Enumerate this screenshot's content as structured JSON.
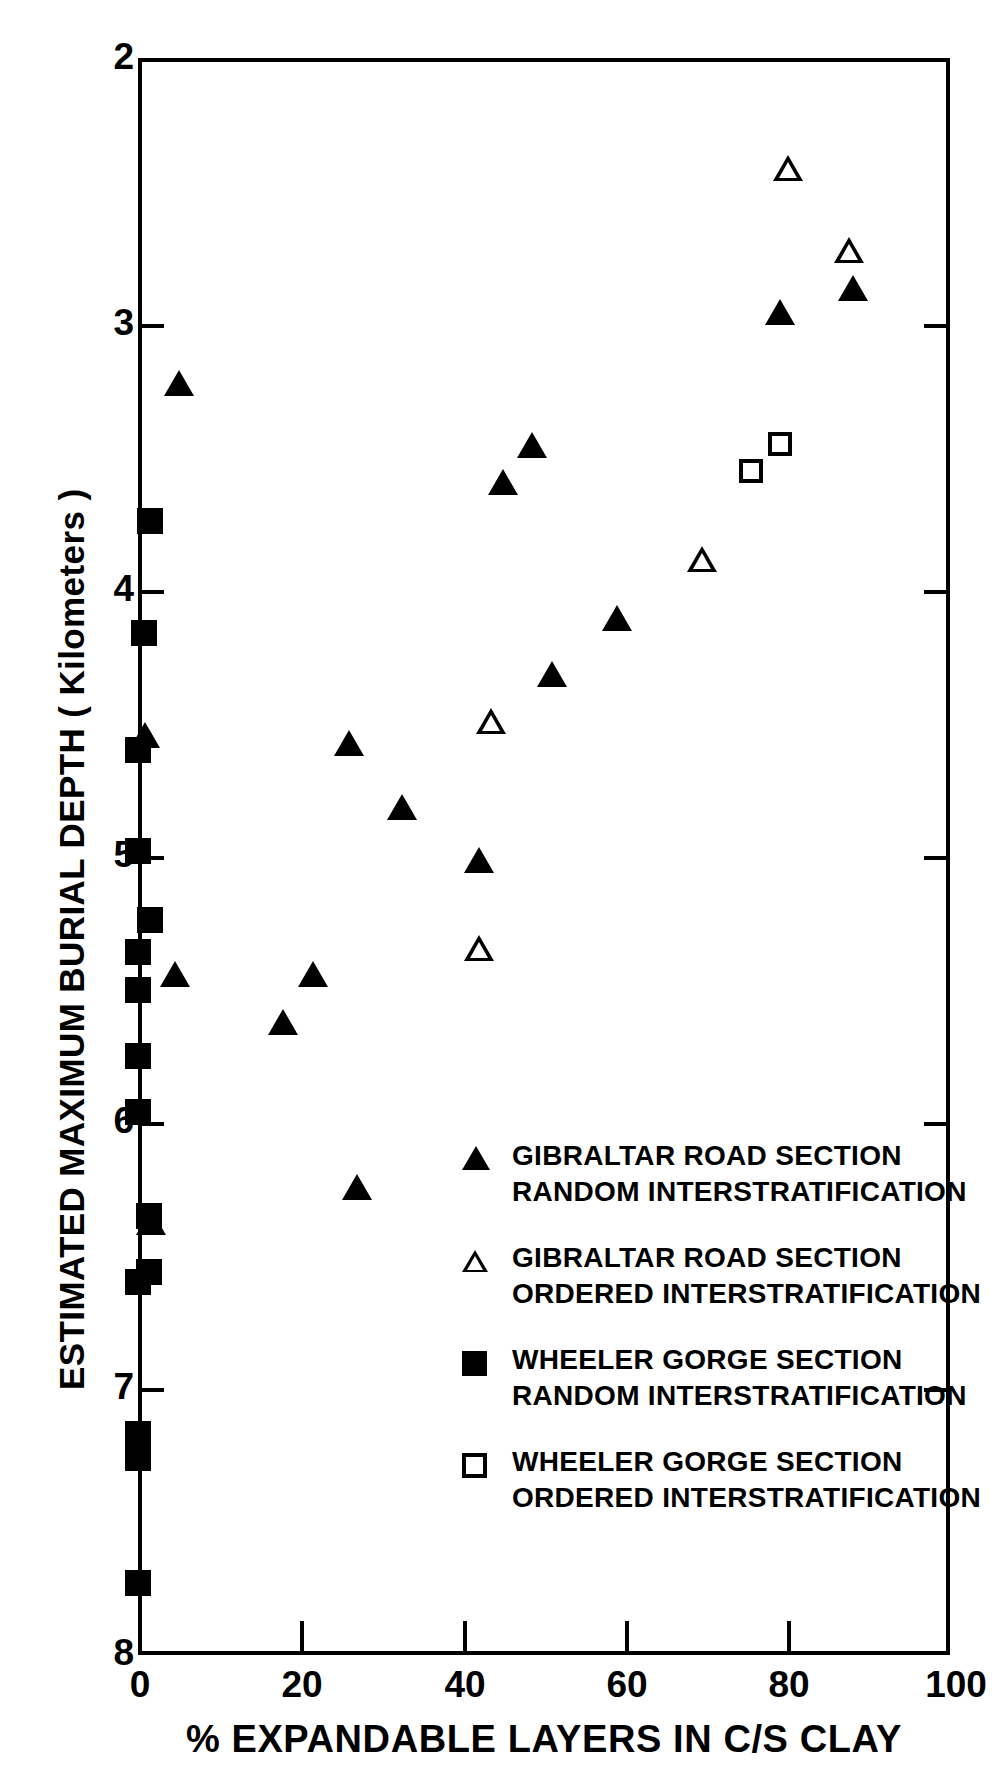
{
  "chart_data": {
    "type": "scatter",
    "title": "",
    "xlabel": "% EXPANDABLE LAYERS IN C/S CLAY",
    "ylabel": "ESTIMATED MAXIMUM BURIAL DEPTH ( Kilometers )",
    "xlim": [
      0,
      100
    ],
    "ylim": [
      8,
      2
    ],
    "y_inverted": true,
    "grid": false,
    "x_ticks": [
      0,
      20,
      40,
      60,
      80,
      100
    ],
    "x_tick_labels": [
      "0",
      "20",
      "40",
      "60",
      "80",
      "100"
    ],
    "y_ticks": [
      2,
      3,
      4,
      5,
      6,
      7,
      8
    ],
    "y_tick_labels": [
      "2",
      "3",
      "4",
      "5",
      "6",
      "7",
      "8"
    ],
    "legend_position": "inside-lower-center-right",
    "series": [
      {
        "name": "GIBRALTAR ROAD SECTION RANDOM INTERSTRATIFICATION",
        "marker": "filled-triangle",
        "color": "#000000",
        "points": [
          {
            "x": 5.0,
            "y": 3.23
          },
          {
            "x": 0.8,
            "y": 4.55
          },
          {
            "x": 1.6,
            "y": 6.38
          },
          {
            "x": 4.6,
            "y": 5.45
          },
          {
            "x": 17.8,
            "y": 5.63
          },
          {
            "x": 21.5,
            "y": 5.45
          },
          {
            "x": 26.0,
            "y": 4.58
          },
          {
            "x": 27.0,
            "y": 6.25
          },
          {
            "x": 32.5,
            "y": 4.82
          },
          {
            "x": 42.0,
            "y": 5.02
          },
          {
            "x": 45.0,
            "y": 3.6
          },
          {
            "x": 48.5,
            "y": 3.46
          },
          {
            "x": 51.0,
            "y": 4.32
          },
          {
            "x": 59.0,
            "y": 4.11
          },
          {
            "x": 79.0,
            "y": 2.96
          },
          {
            "x": 88.0,
            "y": 2.87
          }
        ]
      },
      {
        "name": "GIBRALTAR ROAD SECTION ORDERED INTERSTRATIFICATION",
        "marker": "open-triangle",
        "color": "#000000",
        "points": [
          {
            "x": 43.5,
            "y": 4.5
          },
          {
            "x": 42.0,
            "y": 5.35
          },
          {
            "x": 69.5,
            "y": 3.89
          },
          {
            "x": 80.0,
            "y": 2.42
          },
          {
            "x": 87.5,
            "y": 2.73
          }
        ]
      },
      {
        "name": "WHEELER GORGE SECTION RANDOM INTERSTRATIFICATION",
        "marker": "filled-square",
        "color": "#000000",
        "points": [
          {
            "x": 1.5,
            "y": 3.74
          },
          {
            "x": 0.7,
            "y": 4.16
          },
          {
            "x": 0.0,
            "y": 4.6
          },
          {
            "x": 0.0,
            "y": 4.98
          },
          {
            "x": 1.5,
            "y": 5.24
          },
          {
            "x": 0.0,
            "y": 5.36
          },
          {
            "x": 0.0,
            "y": 5.5
          },
          {
            "x": 0.0,
            "y": 5.75
          },
          {
            "x": 0.0,
            "y": 5.96
          },
          {
            "x": 1.3,
            "y": 6.35
          },
          {
            "x": 0.0,
            "y": 6.6
          },
          {
            "x": 1.4,
            "y": 6.56
          },
          {
            "x": 0.0,
            "y": 7.17
          },
          {
            "x": 0.0,
            "y": 7.26
          },
          {
            "x": 0.0,
            "y": 7.73
          }
        ]
      },
      {
        "name": "WHEELER GORGE SECTION ORDERED INTERSTRATIFICATION",
        "marker": "open-square",
        "color": "#000000",
        "points": [
          {
            "x": 75.5,
            "y": 3.55
          },
          {
            "x": 79.0,
            "y": 3.45
          }
        ]
      }
    ]
  },
  "axes": {
    "y_title": "ESTIMATED MAXIMUM BURIAL DEPTH ( Kilometers )",
    "x_title": "% EXPANDABLE LAYERS IN C/S CLAY",
    "y_labels": [
      "2",
      "3",
      "4",
      "5",
      "6",
      "7",
      "8"
    ],
    "x_labels": [
      "0",
      "20",
      "40",
      "60",
      "80",
      "100"
    ]
  },
  "legend": {
    "entries": [
      {
        "marker": "filled-triangle",
        "line1": "GIBRALTAR ROAD SECTION",
        "line2": "RANDOM  INTERSTRATIFICATION"
      },
      {
        "marker": "open-triangle",
        "line1": "GIBRALTAR ROAD SECTION",
        "line2": "ORDERED  INTERSTRATIFICATION"
      },
      {
        "marker": "filled-square",
        "line1": "WHEELER GORGE SECTION",
        "line2": "RANDOM  INTERSTRATIFICATION"
      },
      {
        "marker": "open-square",
        "line1": "WHEELER GORGE SECTION",
        "line2": "ORDERED  INTERSTRATIFICATION"
      }
    ]
  },
  "edge_caption": {
    "text": ""
  },
  "colors": {
    "foreground": "#000000",
    "background": "#ffffff"
  }
}
